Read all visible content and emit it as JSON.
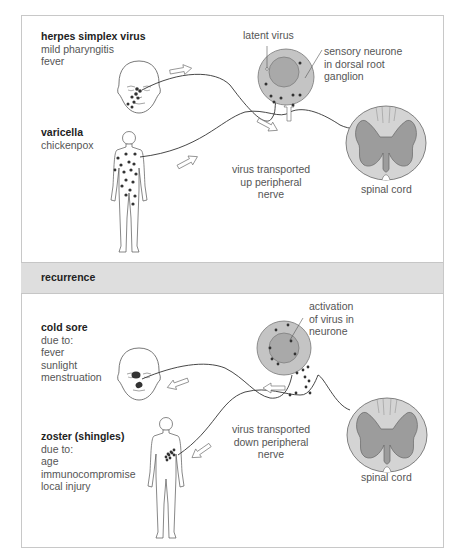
{
  "primary_infection": {
    "herpes_simplex": {
      "title": "herpes simplex virus",
      "lines": [
        "mild pharyngitis",
        "fever"
      ]
    },
    "varicella": {
      "title": "varicella",
      "lines": [
        "chickenpox"
      ]
    },
    "latent_virus_label": "latent virus",
    "neurone_label": [
      "sensory neurone",
      "in dorsal root",
      "ganglion"
    ],
    "transport_label": [
      "virus transported",
      "up peripheral",
      "nerve"
    ],
    "spinal_cord_label": "spinal cord"
  },
  "section_header": "recurrence",
  "recurrence": {
    "cold_sore": {
      "title": "cold sore",
      "lines": [
        "due to:",
        "fever",
        "sunlight",
        "menstruation"
      ]
    },
    "zoster": {
      "title": "zoster (shingles)",
      "lines": [
        "due to:",
        "age",
        "immunocompromise",
        "local injury"
      ]
    },
    "activation_label": [
      "activation",
      "of virus in",
      "neurone"
    ],
    "transport_label": [
      "virus transported",
      "down peripheral",
      "nerve"
    ],
    "spinal_cord_label": "spinal cord"
  },
  "colors": {
    "neurone_fill": "#c4c4c4",
    "nucleus_fill": "#a9a9a9",
    "cord_white": "#d4d4d4",
    "cord_grey": "#9c9c9c",
    "band": "#dedede",
    "dot": "#333333"
  }
}
